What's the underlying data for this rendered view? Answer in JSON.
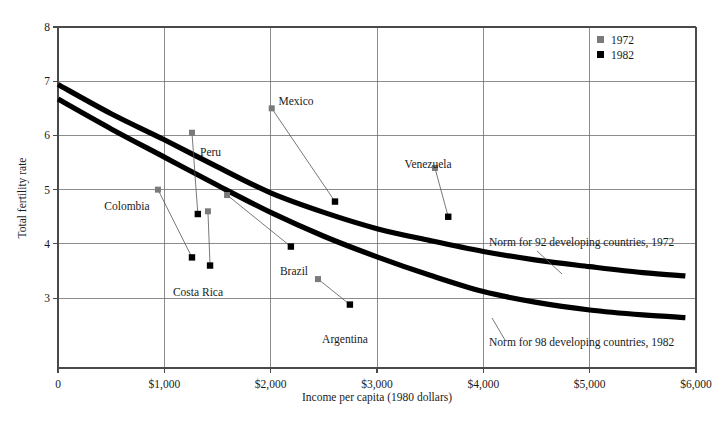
{
  "chart_data": {
    "type": "scatter",
    "title": "",
    "xlabel": "Income per capita (1980 dollars)",
    "ylabel": "Total fertility rate",
    "xlim": [
      0,
      6000
    ],
    "ylim": [
      1.71,
      8
    ],
    "grid": true,
    "legend_position": "top-right",
    "x_ticks": [
      {
        "value": 0,
        "label": "0"
      },
      {
        "value": 1000,
        "label": "$1,000"
      },
      {
        "value": 2000,
        "label": "$2,000"
      },
      {
        "value": 3000,
        "label": "$3,000"
      },
      {
        "value": 4000,
        "label": "$4,000"
      },
      {
        "value": 5000,
        "label": "$5,000"
      },
      {
        "value": 6000,
        "label": "$6,000"
      }
    ],
    "y_ticks": [
      {
        "value": 3,
        "label": "3"
      },
      {
        "value": 4,
        "label": "4"
      },
      {
        "value": 5,
        "label": "5"
      },
      {
        "value": 6,
        "label": "6"
      },
      {
        "value": 7,
        "label": "7"
      },
      {
        "value": 8,
        "label": "8"
      }
    ],
    "legend": [
      {
        "name": "1972",
        "color": "#7a7a7a",
        "marker": "square"
      },
      {
        "name": "1982",
        "color": "#000000",
        "marker": "square"
      }
    ],
    "series": [
      {
        "name": "1972",
        "color": "#7a7a7a",
        "points": [
          {
            "country": "Colombia",
            "x": 940,
            "y": 5.0
          },
          {
            "country": "Peru",
            "x": 1260,
            "y": 6.05
          },
          {
            "country": "Costa Rica",
            "x": 1410,
            "y": 4.6
          },
          {
            "country": "Brazil",
            "x": 1590,
            "y": 4.9
          },
          {
            "country": "Mexico",
            "x": 2010,
            "y": 6.5
          },
          {
            "country": "Argentina",
            "x": 2445,
            "y": 3.35
          },
          {
            "country": "Venezuela",
            "x": 3545,
            "y": 5.4
          }
        ]
      },
      {
        "name": "1982",
        "color": "#000000",
        "points": [
          {
            "country": "Colombia",
            "x": 1260,
            "y": 3.75
          },
          {
            "country": "Peru",
            "x": 1315,
            "y": 4.55
          },
          {
            "country": "Costa Rica",
            "x": 1430,
            "y": 3.6
          },
          {
            "country": "Brazil",
            "x": 2190,
            "y": 3.95
          },
          {
            "country": "Mexico",
            "x": 2605,
            "y": 4.78
          },
          {
            "country": "Argentina",
            "x": 2745,
            "y": 2.88
          },
          {
            "country": "Venezuela",
            "x": 3670,
            "y": 4.5
          }
        ]
      }
    ],
    "curves": [
      {
        "name": "Norm for 92 developing countries, 1972",
        "label": "Norm for 92 developing countries, 1972",
        "color": "#000000",
        "points": [
          {
            "x": 0,
            "y": 6.94
          },
          {
            "x": 500,
            "y": 6.4
          },
          {
            "x": 1000,
            "y": 5.92
          },
          {
            "x": 1500,
            "y": 5.42
          },
          {
            "x": 2000,
            "y": 4.94
          },
          {
            "x": 2500,
            "y": 4.58
          },
          {
            "x": 3000,
            "y": 4.28
          },
          {
            "x": 3500,
            "y": 4.06
          },
          {
            "x": 4000,
            "y": 3.86
          },
          {
            "x": 4500,
            "y": 3.7
          },
          {
            "x": 5000,
            "y": 3.58
          },
          {
            "x": 5500,
            "y": 3.47
          },
          {
            "x": 5900,
            "y": 3.41
          }
        ]
      },
      {
        "name": "Norm for 98 developing countries, 1982",
        "label": "Norm for 98 developing countries, 1982",
        "color": "#000000",
        "points": [
          {
            "x": 0,
            "y": 6.67
          },
          {
            "x": 500,
            "y": 6.12
          },
          {
            "x": 1000,
            "y": 5.6
          },
          {
            "x": 1500,
            "y": 5.08
          },
          {
            "x": 2000,
            "y": 4.58
          },
          {
            "x": 2500,
            "y": 4.14
          },
          {
            "x": 3000,
            "y": 3.76
          },
          {
            "x": 3500,
            "y": 3.42
          },
          {
            "x": 4000,
            "y": 3.12
          },
          {
            "x": 4500,
            "y": 2.92
          },
          {
            "x": 5000,
            "y": 2.78
          },
          {
            "x": 5500,
            "y": 2.69
          },
          {
            "x": 5900,
            "y": 2.64
          }
        ]
      }
    ],
    "annotations": [
      {
        "name": "Mexico",
        "text": "Mexico",
        "anchor": "middle"
      },
      {
        "name": "Peru",
        "text": "Peru",
        "anchor": "start"
      },
      {
        "name": "Venezuela",
        "text": "Venezuela",
        "anchor": "middle"
      },
      {
        "name": "Colombia",
        "text": "Colombia",
        "anchor": "middle"
      },
      {
        "name": "Costa Rica",
        "text": "Costa Rica",
        "anchor": "middle"
      },
      {
        "name": "Brazil",
        "text": "Brazil",
        "anchor": "middle"
      },
      {
        "name": "Argentina",
        "text": "Argentina",
        "anchor": "middle"
      }
    ]
  },
  "axis": {
    "y_title": "Total fertility rate",
    "x_title": "Income per capita (1980 dollars)"
  },
  "legend": {
    "items": [
      {
        "label": "1972"
      },
      {
        "label": "1982"
      }
    ]
  },
  "labels": {
    "mexico": "Mexico",
    "peru": "Peru",
    "venezuela": "Venezuela",
    "colombia": "Colombia",
    "costa_rica": "Costa Rica",
    "brazil": "Brazil",
    "argentina": "Argentina",
    "norm_1972": "Norm for 92 developing countries, 1972",
    "norm_1982": "Norm for 98 developing countries, 1982"
  },
  "ticks": {
    "x": [
      "0",
      "$1,000",
      "$2,000",
      "$3,000",
      "$4,000",
      "$5,000",
      "$6,000"
    ],
    "y": [
      "3",
      "4",
      "5",
      "6",
      "7",
      "8"
    ]
  },
  "colors": {
    "marker_1972": "#7a7a7a",
    "marker_1982": "#000000",
    "grid": "#6f6f6f",
    "axis": "#4a4a4a"
  }
}
